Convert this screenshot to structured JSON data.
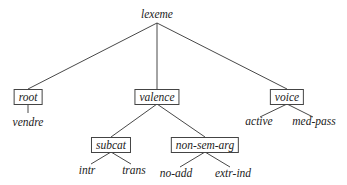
{
  "diagram": {
    "type": "type-hierarchy-tree",
    "root": {
      "label": "lexeme",
      "boxed": false,
      "children": [
        {
          "label": "root",
          "boxed": true,
          "children": [
            {
              "label": "vendre",
              "boxed": false
            }
          ]
        },
        {
          "label": "valence",
          "boxed": true,
          "children": [
            {
              "label": "subcat",
              "boxed": true,
              "children": [
                {
                  "label": "intr",
                  "boxed": false
                },
                {
                  "label": "trans",
                  "boxed": false
                }
              ]
            },
            {
              "label": "non-sem-arg",
              "boxed": true,
              "children": [
                {
                  "label": "no-add",
                  "boxed": false
                },
                {
                  "label": "extr-ind",
                  "boxed": false
                }
              ]
            }
          ]
        },
        {
          "label": "voice",
          "boxed": true,
          "children": [
            {
              "label": "active",
              "boxed": false
            },
            {
              "label": "med-pass",
              "boxed": false
            }
          ]
        }
      ]
    }
  },
  "nodes": {
    "lexeme": "lexeme",
    "root": "root",
    "vendre": "vendre",
    "valence": "valence",
    "subcat": "subcat",
    "intr": "intr",
    "trans": "trans",
    "non_sem_arg": "non-sem-arg",
    "no_add": "no-add",
    "extr_ind": "extr-ind",
    "voice": "voice",
    "active": "active",
    "med_pass": "med-pass"
  },
  "colors": {
    "line": "#333333",
    "text": "#222222",
    "box_border": "#444444"
  }
}
